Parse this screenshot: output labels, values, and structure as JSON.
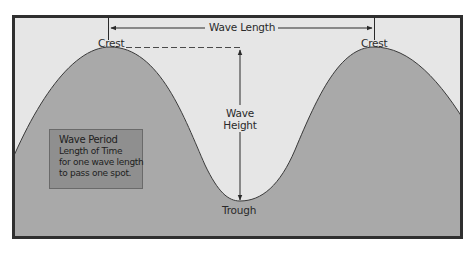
{
  "diagram": {
    "labels": {
      "wave_length": "Wave Length",
      "crest_left": "Crest",
      "crest_right": "Crest",
      "wave_height_line1": "Wave",
      "wave_height_line2": "Height",
      "trough": "Trough"
    },
    "wave_period_box": {
      "title": "Wave Period",
      "lines": [
        "Length of Time",
        "for one wave length",
        "to pass one spot."
      ]
    },
    "colors": {
      "frame_border": "#2f2f2f",
      "background": "#e6e6e6",
      "wave_fill": "#a9a9a9",
      "wave_stroke": "#3a3a3a",
      "period_box_fill": "#8f8f8f",
      "text": "#2a2a2a"
    }
  }
}
